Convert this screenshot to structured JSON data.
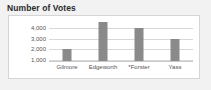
{
  "chart_data": {
    "type": "bar",
    "title": "Number of Votes",
    "xlabel": "",
    "ylabel": "",
    "categories": [
      "Gilmore",
      "Edgeworth",
      "*Forster",
      "Yass"
    ],
    "values": [
      2000,
      4600,
      4000,
      3000
    ],
    "ytick_labels": [
      "1,000",
      "2,000",
      "3,000",
      "4,000"
    ],
    "ytick_values": [
      1000,
      2000,
      3000,
      4000
    ],
    "ylim": [
      800,
      4900
    ],
    "grid": true,
    "legend": "none",
    "colors": {
      "bar": "#8a8a8a",
      "gridline": "#d8d8d8",
      "panel_background": "#ffffff",
      "panel_border": "#d5d5d5",
      "page_background": "#f2f2f2",
      "title_text": "#2b2b2b",
      "tick_text": "#555555"
    }
  }
}
